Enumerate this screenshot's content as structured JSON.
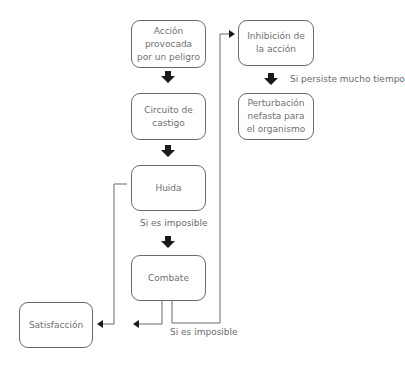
{
  "nodes": {
    "accion": "Acción provocada por un peligro",
    "circuito": "Circuito de castigo",
    "huida": "Huida",
    "combate": "Combate",
    "satisfaccion": "Satisfacción",
    "inhibicion": "Inhibición de la acción",
    "perturbacion": "Perturbación nefasta para el organismo"
  },
  "labels": {
    "huida_imposible": "Si es imposible",
    "combate_imposible": "Si es imposible",
    "persiste": "Si persiste mucho tiempo"
  },
  "colors": {
    "line": "#6a6a6a",
    "arrow": "#1a1a1a",
    "text": "#707070"
  }
}
